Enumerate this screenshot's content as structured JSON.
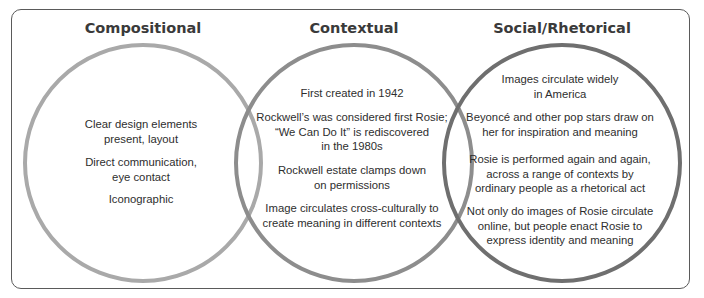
{
  "diagram": {
    "type": "venn",
    "colors": {
      "compositional": "#a9a9a9",
      "contextual": "#8d8d8d",
      "social": "#6f6f6f",
      "frame": "#5a5a5a"
    },
    "sets": [
      {
        "title": "Compositional",
        "items": [
          "Clear design elements present, layout",
          "Direct communication, eye contact",
          "Iconographic"
        ]
      },
      {
        "title": "Contextual",
        "items": [
          "First created in 1942",
          "Rockwell’s was considered first Rosie; “We Can Do It” is rediscovered in the 1980s",
          "Rockwell estate clamps down on permissions",
          "Image circulates cross-culturally to create meaning in different contexts"
        ]
      },
      {
        "title": "Social/Rhetorical",
        "items": [
          "Images circulate widely in America",
          "Beyoncé and other pop stars draw on her for inspiration and meaning",
          "Rosie is performed again and again, across a range of contexts by ordinary people as a rhetorical act",
          "Not only do images of Rosie circulate online, but people enact Rosie to express identity and meaning"
        ]
      }
    ]
  },
  "lines": {
    "c0": [
      "Clear design elements",
      "present, layout"
    ],
    "c1": [
      "Direct communication,",
      "eye contact"
    ],
    "c2": [
      "Iconographic"
    ],
    "m0": [
      "First created in 1942"
    ],
    "m1": [
      "Rockwell’s was considered first Rosie;",
      "“We Can Do It” is rediscovered",
      "in the 1980s"
    ],
    "m2": [
      "Rockwell estate clamps down",
      "on permissions"
    ],
    "m3": [
      "Image circulates cross-culturally to",
      "create meaning in different contexts"
    ],
    "s0": [
      "Images circulate widely",
      "in America"
    ],
    "s1": [
      "Beyoncé and other pop stars draw on",
      "her for inspiration and meaning"
    ],
    "s2": [
      "Rosie is performed again and again,",
      "across a range of contexts by",
      "ordinary people as a rhetorical act"
    ],
    "s3": [
      "Not only do images of Rosie circulate",
      "online, but people enact Rosie to",
      "express identity and meaning"
    ]
  }
}
